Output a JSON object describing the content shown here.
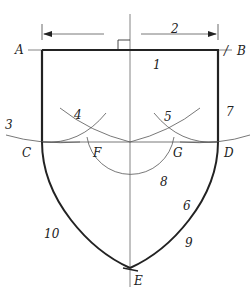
{
  "diagram": {
    "type": "geometric-construction",
    "colors": {
      "stroke": "#222222",
      "thin_stroke": "#555555",
      "background": "#ffffff"
    },
    "points": {
      "A": {
        "label": "A",
        "x": 42,
        "y": 50
      },
      "B": {
        "label": "B",
        "x": 218,
        "y": 50
      },
      "C": {
        "label": "C",
        "x": 42,
        "y": 142
      },
      "D": {
        "label": "D",
        "x": 218,
        "y": 142
      },
      "E": {
        "label": "E",
        "x": 130,
        "y": 268
      },
      "F": {
        "label": "F",
        "x": 88,
        "y": 142
      },
      "G": {
        "label": "G",
        "x": 172,
        "y": 142
      }
    },
    "step_labels": {
      "s1": "1",
      "s2": "2",
      "s3": "3",
      "s4": "4",
      "s5": "5",
      "s6": "6",
      "s7": "7",
      "s8": "8",
      "s9": "9",
      "s10": "10"
    },
    "tick_mark": "/"
  }
}
